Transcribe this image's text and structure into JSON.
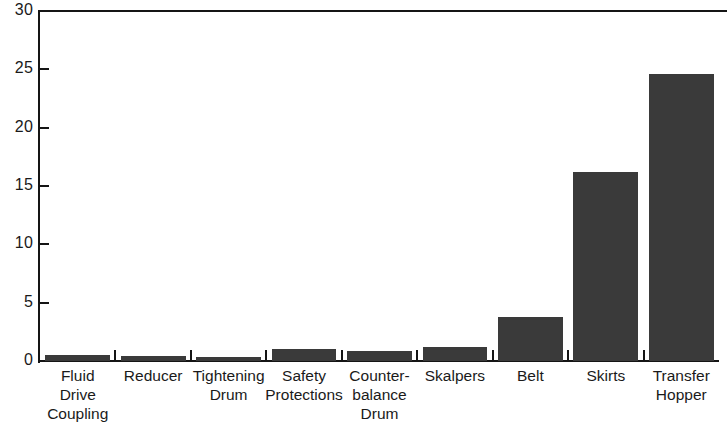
{
  "chart_data": {
    "type": "bar",
    "title": "",
    "subtitle": "",
    "xlabel": "",
    "ylabel": "",
    "ylim": [
      0,
      30
    ],
    "yticks": [
      0,
      5,
      10,
      15,
      20,
      25,
      30
    ],
    "ytick_labels": [
      "0",
      "5",
      "10",
      "15",
      "20",
      "25",
      "30"
    ],
    "grid": false,
    "legend": false,
    "legend_position": "none",
    "bar_color": "#3a3a3a",
    "axis_color": "#151515",
    "categories": [
      "Fluid\nDrive\nCoupling",
      "Reducer",
      "Tightening\nDrum",
      "Safety\nProtections",
      "Counter-\nbalance\nDrum",
      "Skalpers",
      "Belt",
      "Skirts",
      "Transfer\nHopper"
    ],
    "values": [
      0.5,
      0.4,
      0.35,
      1.0,
      0.85,
      1.2,
      3.8,
      16.2,
      24.6
    ],
    "series": [
      {
        "name": "",
        "values": [
          0.5,
          0.4,
          0.35,
          1.0,
          0.85,
          1.2,
          3.8,
          16.2,
          24.6
        ]
      }
    ]
  }
}
